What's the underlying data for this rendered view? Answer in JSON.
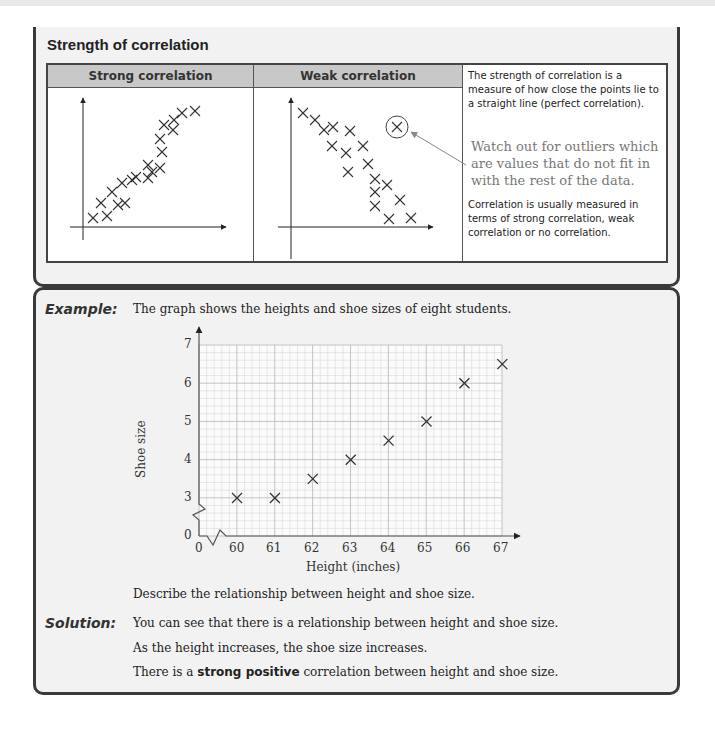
{
  "strength_section": {
    "title": "Strength of correlation",
    "table": {
      "headers": [
        "Strong correlation",
        "Weak correlation"
      ],
      "description_top": "The strength of correlation is a measure of how close the points lie to a straight line (perfect correlation).",
      "outlier_note": "Watch out for outliers which are values that do not fit in with the rest of the data.",
      "description_bottom": "Correlation is usually measured in terms of strong correlation, weak correlation or no correlation."
    }
  },
  "example": {
    "label": "Example:",
    "intro": "The graph shows the heights and shoe sizes of eight students.",
    "question": "Describe the relationship between height and shoe size."
  },
  "solution": {
    "label": "Solution:",
    "line1": "You can see that there is a relationship between height and shoe size.",
    "line2": "As the height increases, the shoe size increases.",
    "line3_prefix": "There is a",
    "line3_bold": "strong positive",
    "line3_suffix": "correlation between height and shoe size."
  },
  "chart_data": [
    {
      "type": "scatter",
      "title": "Strong correlation",
      "xlabel": "",
      "ylabel": "",
      "note": "schematic, no numeric axes; points lie close to an upward line",
      "points_px": [
        [
          93,
          218
        ],
        [
          101,
          203
        ],
        [
          107,
          216
        ],
        [
          112,
          192
        ],
        [
          118,
          205
        ],
        [
          122,
          183
        ],
        [
          125,
          203
        ],
        [
          132,
          180
        ],
        [
          136,
          177
        ],
        [
          148,
          178
        ],
        [
          148,
          165
        ],
        [
          152,
          172
        ],
        [
          160,
          168
        ],
        [
          162,
          152
        ],
        [
          160,
          139
        ],
        [
          164,
          125
        ],
        [
          173,
          130
        ],
        [
          174,
          120
        ],
        [
          182,
          113
        ],
        [
          195,
          111
        ]
      ]
    },
    {
      "type": "scatter",
      "title": "Weak correlation",
      "xlabel": "",
      "ylabel": "",
      "note": "schematic, negative trend with wide spread; one circled outlier",
      "points_px": [
        [
          303,
          113
        ],
        [
          315,
          120
        ],
        [
          324,
          130
        ],
        [
          333,
          127
        ],
        [
          350,
          131
        ],
        [
          332,
          146
        ],
        [
          346,
          153
        ],
        [
          363,
          146
        ],
        [
          348,
          172
        ],
        [
          368,
          164
        ],
        [
          375,
          179
        ],
        [
          387,
          185
        ],
        [
          375,
          192
        ],
        [
          400,
          200
        ],
        [
          375,
          206
        ],
        [
          389,
          219
        ],
        [
          411,
          218
        ]
      ],
      "outlier_px": [
        397,
        127
      ]
    },
    {
      "type": "scatter",
      "title": "",
      "xlabel": "Height (inches)",
      "ylabel": "Shoe size",
      "x_ticks": [
        "0",
        "60",
        "61",
        "62",
        "63",
        "64",
        "65",
        "66",
        "67"
      ],
      "y_ticks": [
        "0",
        "3",
        "4",
        "5",
        "6",
        "7"
      ],
      "xlim": [
        60,
        67
      ],
      "ylim": [
        3,
        7
      ],
      "axis_breaks": true,
      "grid": true,
      "x": [
        60,
        61,
        62,
        63,
        64,
        65,
        66,
        67
      ],
      "y": [
        3,
        3,
        3.5,
        4,
        4.5,
        5,
        6,
        6.5
      ]
    }
  ]
}
